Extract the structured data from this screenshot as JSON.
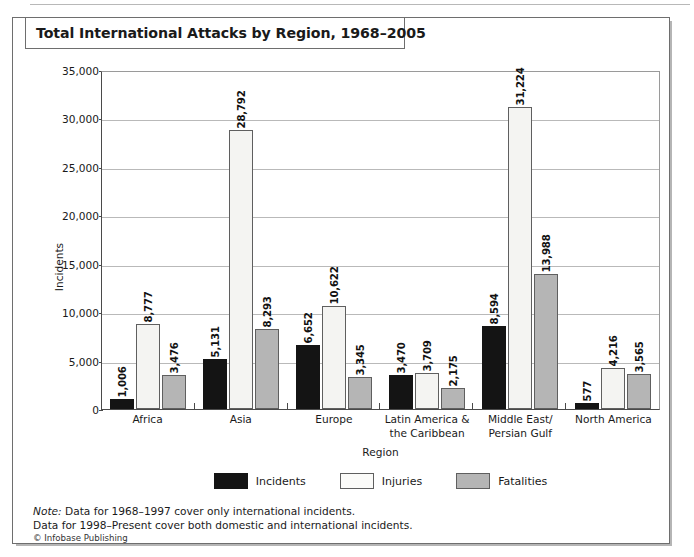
{
  "figure": {
    "title": "Total International Attacks by Region, 1968–2005",
    "note_prefix": "Note:",
    "note_line1": " Data for 1968–1997 cover only international incidents.",
    "note_line2": "Data for 1998–Present cover both domestic and international incidents.",
    "credit": "© Infobase Publishing"
  },
  "chart_data": {
    "type": "bar",
    "title": "Total International Attacks by Region, 1968–2005",
    "xlabel": "Region",
    "ylabel": "Incidents",
    "ylim": [
      0,
      35000
    ],
    "ytick_labels": [
      "35,000",
      "30,000",
      "25,000",
      "20,000",
      "15,000",
      "10,000",
      "5,000",
      "0"
    ],
    "ytick_values": [
      35000,
      30000,
      25000,
      20000,
      15000,
      10000,
      5000,
      0
    ],
    "grid": true,
    "legend_position": "bottom",
    "categories": [
      "Africa",
      "Asia",
      "Europe",
      "Latin America &\nthe Caribbean",
      "Middle East/\nPersian Gulf",
      "North America"
    ],
    "category_lines": [
      [
        "Africa"
      ],
      [
        "Asia"
      ],
      [
        "Europe"
      ],
      [
        "Latin America &",
        "the Caribbean"
      ],
      [
        "Middle East/",
        "Persian Gulf"
      ],
      [
        "North America"
      ]
    ],
    "series": [
      {
        "name": "Incidents",
        "color": "#141414",
        "values": [
          1006,
          5131,
          6652,
          3470,
          8594,
          577
        ],
        "labels": [
          "1,006",
          "5,131",
          "6,652",
          "3,470",
          "8,594",
          "577"
        ]
      },
      {
        "name": "Injuries",
        "color": "#f4f4f2",
        "values": [
          8777,
          28792,
          10622,
          3709,
          31224,
          4216
        ],
        "labels": [
          "8,777",
          "28,792",
          "10,622",
          "3,709",
          "31,224",
          "4,216"
        ]
      },
      {
        "name": "Fatalities",
        "color": "#b5b5b5",
        "values": [
          3476,
          8293,
          3345,
          2175,
          13988,
          3565
        ],
        "labels": [
          "3,476",
          "8,293",
          "3,345",
          "2,175",
          "13,988",
          "3,565"
        ]
      }
    ]
  }
}
